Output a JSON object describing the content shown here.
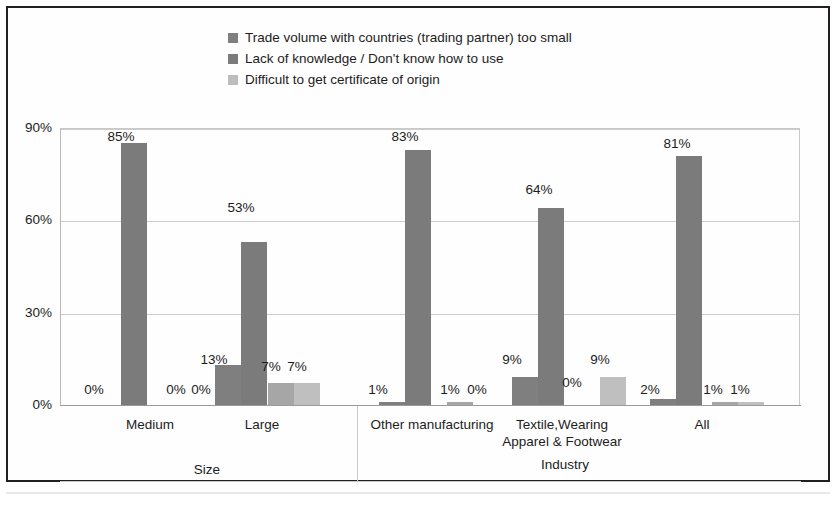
{
  "chart_data": {
    "type": "bar",
    "title": "",
    "xlabel": "",
    "ylabel": "",
    "ylim": [
      0,
      90
    ],
    "ytick_labels": [
      "0%",
      "30%",
      "60%",
      "90%"
    ],
    "ytick_values": [
      0,
      30,
      60,
      90
    ],
    "grid": true,
    "legend_position": "top-center",
    "series": [
      {
        "name": "Trade volume with countries (trading partner) too small",
        "color": "#7f7f7f",
        "values": [
          0,
          13,
          1,
          9,
          2
        ],
        "value_labels": [
          "0%",
          "13%",
          "1%",
          "9%",
          "2%"
        ]
      },
      {
        "name": "Lack of knowledge / Don't know how to use",
        "color": "#7b7b7b",
        "values": [
          85,
          53,
          83,
          64,
          81
        ],
        "value_labels": [
          "85%",
          "53%",
          "83%",
          "64%",
          "81%"
        ]
      },
      {
        "name": "Difficult to get certificate of origin",
        "color": "#a6a6a6",
        "values": [
          0,
          7,
          1,
          0,
          1
        ],
        "value_labels": [
          "0%",
          "7%",
          "1%",
          "0%",
          "1%"
        ]
      },
      {
        "name": "Other",
        "color": "#bfbfbf",
        "values": [
          0,
          7,
          0,
          9,
          1
        ],
        "value_labels": [
          "0%",
          "7%",
          "0%",
          "9%",
          "1%"
        ]
      }
    ],
    "categories": [
      "Medium",
      "Large",
      "Other manufacturing",
      "Textile,Wearing\nApparel & Footwear",
      "All"
    ],
    "category_lines": [
      [
        "Medium"
      ],
      [
        "Large"
      ],
      [
        "Other manufacturing"
      ],
      [
        "Textile,Wearing",
        "Apparel & Footwear"
      ],
      [
        "All"
      ]
    ],
    "groups": [
      {
        "label": "Size",
        "categories": [
          "Medium",
          "Large"
        ]
      },
      {
        "label": "Industry",
        "categories": [
          "Other manufacturing",
          "Textile,Wearing Apparel & Footwear",
          "All"
        ]
      }
    ]
  },
  "legend": {
    "items": [
      {
        "label": "Trade volume with countries (trading partner) too small",
        "color": "#7f7f7f"
      },
      {
        "label": "Lack of knowledge / Don't know how to use",
        "color": "#7b7b7b"
      },
      {
        "label": "Difficult to get certificate of origin",
        "color": "#bdbdbd"
      }
    ]
  },
  "axis": {
    "y_labels": [
      "90%",
      "60%",
      "30%",
      "0%"
    ]
  },
  "group_labels": [
    "Size",
    "Industry"
  ],
  "colors": {
    "series1": "#7f7f7f",
    "series2": "#7b7b7b",
    "series3": "#a6a6a6",
    "series4": "#bfbfbf",
    "grid": "#cccccc",
    "frame": "#231f20",
    "axis": "#9a9a9a",
    "text": "#1c1c1c"
  }
}
